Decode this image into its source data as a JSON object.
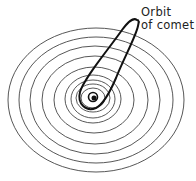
{
  "diagram": {
    "label": {
      "line1": "Orbit",
      "line2": "of comet"
    },
    "sun": {
      "cx": 93,
      "cy": 97,
      "r": 5
    },
    "planet_orbits": [
      {
        "rx": 12,
        "ry": 10
      },
      {
        "rx": 17,
        "ry": 14
      },
      {
        "rx": 22,
        "ry": 19
      },
      {
        "rx": 28,
        "ry": 24
      },
      {
        "rx": 40,
        "ry": 33
      },
      {
        "rx": 53,
        "ry": 44
      },
      {
        "rx": 65,
        "ry": 54
      },
      {
        "rx": 77,
        "ry": 63
      },
      {
        "rx": 88,
        "ry": 72
      }
    ],
    "colors": {
      "line": "#333333",
      "comet": "#111111",
      "background": "#ffffff"
    }
  }
}
